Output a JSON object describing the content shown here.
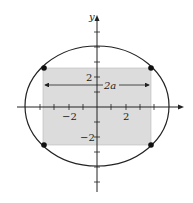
{
  "diagram": {
    "axes": {
      "y_label": "y",
      "x_tick_labels": [
        {
          "text": "−2",
          "value": -2
        },
        {
          "text": "2",
          "value": 2
        }
      ],
      "y_tick_labels": [
        {
          "text": "2",
          "value": 2
        },
        {
          "text": "−2",
          "value": -2
        }
      ]
    },
    "ellipse": {
      "semi_major_x": 5,
      "semi_minor_y": 4
    },
    "rectangle": {
      "fill": "#dcdcdc",
      "corners": [
        "top-left",
        "top-right",
        "bottom-left",
        "bottom-right"
      ]
    },
    "width_annotation": {
      "label": "2a"
    },
    "colors": {
      "stroke": "#222222",
      "rect_fill": "#dcdcdc",
      "background": "#ffffff"
    }
  }
}
